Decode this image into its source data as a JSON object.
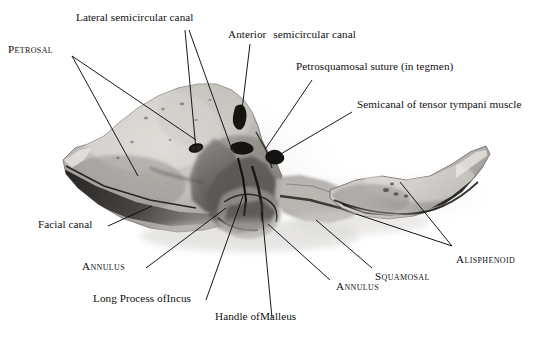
{
  "figure": {
    "kind": "anatomical-photograph",
    "background_color": "#ffffff",
    "ink_color": "#101010",
    "bone_light": "#d8d5d0",
    "bone_mid": "#a9a5a0",
    "bone_dark": "#6d6a66",
    "shadow": "#2e2c2a"
  },
  "labels": {
    "lateral_semicircular_canal": "Lateral semicircular canal",
    "anterior": "Anterior",
    "semicircular_canal": "semicircular canal",
    "petrosal": "Petrosal",
    "petrosquamosal_suture": "Petrosquamosal suture (in tegmen)",
    "semicanal_tensor_tympani": "Semicanal of tensor tympani muscle",
    "facial_canal": "Facial canal",
    "annulus_left": "Annulus",
    "long_process_of_incus_prefix": "Long Process of ",
    "long_process_of_incus_name": "Incus",
    "handle_of_malleus_prefix": "Handle of ",
    "handle_of_malleus_name": "Malleus",
    "annulus_right": "Annulus",
    "squamosal": "Squamosal",
    "alisphenoid": "Alisphenoid"
  }
}
